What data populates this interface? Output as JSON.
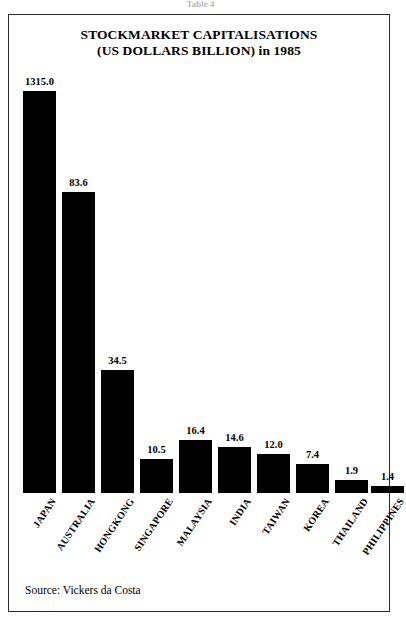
{
  "figure": {
    "caption_cut": "Table 4",
    "source_note": "Source: Vickers da Costa"
  },
  "chart_data": {
    "type": "bar",
    "title": "STOCKMARKET CAPITALISATIONS (US DOLLARS BILLION) in 1985",
    "title_line1": "STOCKMARKET CAPITALISATIONS",
    "title_line2": "(US DOLLARS BILLION) in 1985",
    "xlabel": "",
    "ylabel": "US Dollars Billion",
    "grid": false,
    "legend": false,
    "axis_note": "Bar heights are not linearly proportional to values; the Japan bar is compressed relative to the rest.",
    "categories": [
      "JAPAN",
      "AUSTRALIA",
      "HONGKONG",
      "SINGAPORE",
      "MALAYSIA",
      "INDIA",
      "TAIWAN",
      "KOREA",
      "THAILAND",
      "PHILIPPINES"
    ],
    "values": [
      1315.0,
      83.6,
      34.5,
      10.5,
      16.4,
      14.6,
      12.0,
      7.4,
      1.9,
      1.4
    ],
    "value_labels": [
      "1315.0",
      "83.6",
      "34.5",
      "10.5",
      "16.4",
      "14.6",
      "12.0",
      "7.4",
      "1.9",
      "1.4"
    ],
    "bar_pixel_heights": [
      402,
      301,
      123,
      34,
      53,
      46,
      39,
      29,
      13,
      7
    ],
    "bar_color": "#000000",
    "bars": [
      {
        "category": "JAPAN",
        "value": 1315.0,
        "label": "1315.0",
        "h": 402,
        "x": 0
      },
      {
        "category": "AUSTRALIA",
        "value": 83.6,
        "label": "83.6",
        "h": 301,
        "x": 39
      },
      {
        "category": "HONGKONG",
        "value": 34.5,
        "label": "34.5",
        "h": 123,
        "x": 78
      },
      {
        "category": "SINGAPORE",
        "value": 10.5,
        "label": "10.5",
        "h": 34,
        "x": 117
      },
      {
        "category": "MALAYSIA",
        "value": 16.4,
        "label": "16.4",
        "h": 53,
        "x": 156
      },
      {
        "category": "INDIA",
        "value": 14.6,
        "label": "14.6",
        "h": 46,
        "x": 195
      },
      {
        "category": "TAIWAN",
        "value": 12.0,
        "label": "12.0",
        "h": 39,
        "x": 234
      },
      {
        "category": "KOREA",
        "value": 7.4,
        "label": "7.4",
        "h": 29,
        "x": 273
      },
      {
        "category": "THAILAND",
        "value": 1.9,
        "label": "1.9",
        "h": 13,
        "x": 312
      },
      {
        "category": "PHILIPPINES",
        "value": 1.4,
        "label": "1.4",
        "h": 7,
        "x": 348
      }
    ]
  }
}
